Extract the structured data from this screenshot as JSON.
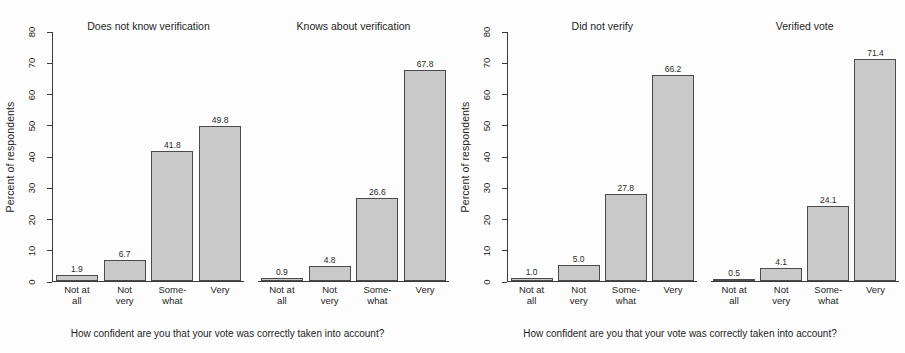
{
  "chart_data": {
    "type": "bar",
    "title": "",
    "categories": [
      "Not at\nall",
      "Not\nvery",
      "Some-\nwhat",
      "Very"
    ],
    "xlabel": "How confident are you that your vote was correctly taken into account?",
    "ylabel": "Percent of respondents",
    "ylim": [
      0,
      80
    ],
    "yticks": [
      0,
      10,
      20,
      30,
      40,
      50,
      60,
      70,
      80
    ],
    "grid": false,
    "legend": "none",
    "bar_color": "#c9c9c9",
    "bar_edge_color": "#4a4a4a",
    "axis_color": "#3a3a3a",
    "panels": [
      {
        "title": "Does not know verification",
        "values": [
          1.9,
          6.7,
          41.8,
          49.8
        ],
        "labels": [
          "1.9",
          "6.7",
          "41.8",
          "49.8"
        ]
      },
      {
        "title": "Knows about verification",
        "values": [
          0.9,
          4.8,
          26.6,
          67.8
        ],
        "labels": [
          "0.9",
          "4.8",
          "26.6",
          "67.8"
        ]
      },
      {
        "title": "Did not verify",
        "values": [
          1.0,
          5.0,
          27.8,
          66.2
        ],
        "labels": [
          "1.0",
          "5.0",
          "27.8",
          "66.2"
        ]
      },
      {
        "title": "Verified vote",
        "values": [
          0.5,
          4.1,
          24.1,
          71.4
        ],
        "labels": [
          "0.5",
          "4.1",
          "24.1",
          "71.4"
        ]
      }
    ]
  },
  "figures": [
    {
      "ylabel": "Percent of respondents",
      "caption": "How confident are you that your vote was correctly taken into account?",
      "panel_indices": [
        0,
        1
      ]
    },
    {
      "ylabel": "Percent of respondents",
      "caption": "How confident are you that your vote was correctly taken into account?",
      "panel_indices": [
        2,
        3
      ]
    }
  ]
}
